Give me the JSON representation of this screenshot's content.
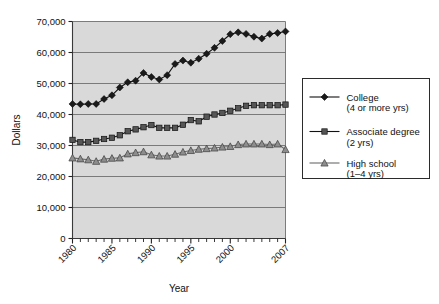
{
  "chart_data": {
    "type": "line",
    "title": "",
    "xlabel": "Year",
    "ylabel": "Dollars",
    "xlim": [
      1980,
      2007
    ],
    "ylim": [
      0,
      70000
    ],
    "grid": true,
    "legend_position": "right",
    "x": [
      1980,
      1981,
      1982,
      1983,
      1984,
      1985,
      1986,
      1987,
      1988,
      1989,
      1990,
      1991,
      1992,
      1993,
      1994,
      1995,
      1996,
      1997,
      1998,
      1999,
      2000,
      2001,
      2002,
      2003,
      2004,
      2005,
      2006,
      2007
    ],
    "x_tick_labels": [
      "1980",
      "1985",
      "1990",
      "1995",
      "2000",
      "2007"
    ],
    "x_tick_values": [
      1980,
      1985,
      1990,
      1995,
      2000,
      2007
    ],
    "y_tick_labels": [
      "0",
      "10,000",
      "20,000",
      "30,000",
      "40,000",
      "50,000",
      "60,000",
      "70,000"
    ],
    "y_tick_values": [
      0,
      10000,
      20000,
      30000,
      40000,
      50000,
      60000,
      70000
    ],
    "series": [
      {
        "name": "College",
        "sub": "(4 or more yrs)",
        "marker": "diamond",
        "color": "#1a1a1a",
        "values": [
          43400,
          43300,
          43400,
          43400,
          45000,
          46200,
          48700,
          50400,
          50900,
          53400,
          52100,
          51300,
          52700,
          56300,
          57400,
          56700,
          58000,
          59600,
          61500,
          63700,
          65900,
          66500,
          66000,
          65100,
          64500,
          66000,
          66300,
          66800
        ]
      },
      {
        "name": "Associate degree",
        "sub": "(2 yrs)",
        "marker": "square",
        "color": "#565656",
        "values": [
          31800,
          31100,
          31100,
          31500,
          32100,
          32500,
          33300,
          34600,
          35200,
          35900,
          36600,
          35700,
          35700,
          35700,
          36700,
          38200,
          37800,
          39300,
          40000,
          40500,
          41200,
          42000,
          42800,
          43000,
          43000,
          43000,
          43000,
          43200
        ]
      },
      {
        "name": "High school",
        "sub": "(1–4 yrs)",
        "marker": "triangle",
        "color": "#8d8d8d",
        "values": [
          26000,
          25700,
          25400,
          24900,
          25600,
          25900,
          26000,
          27300,
          27700,
          28000,
          27000,
          26600,
          26600,
          27200,
          27900,
          28400,
          28800,
          29000,
          29200,
          29500,
          29700,
          30300,
          30500,
          30500,
          30500,
          30300,
          30500,
          28700
        ]
      }
    ]
  },
  "legend": {
    "items": [
      {
        "label": "College",
        "sub": "(4 or more yrs)"
      },
      {
        "label": "Associate degree",
        "sub": "(2 yrs)"
      },
      {
        "label": "High school",
        "sub": "(1–4 yrs)"
      }
    ]
  },
  "axes": {
    "y_title": "Dollars",
    "x_title": "Year"
  }
}
